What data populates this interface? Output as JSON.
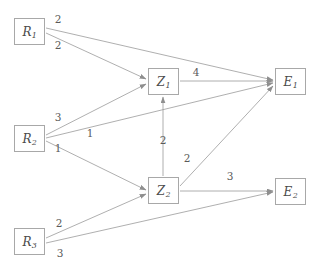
{
  "diagram": {
    "type": "weighted-directed-graph",
    "title": "",
    "nodes": [
      {
        "id": "R1",
        "letter": "R",
        "sub": "1",
        "x": 14,
        "y": 18,
        "w": 31,
        "h": 27
      },
      {
        "id": "R2",
        "letter": "R",
        "sub": "2",
        "x": 14,
        "y": 125,
        "w": 31,
        "h": 27
      },
      {
        "id": "R3",
        "letter": "R",
        "sub": "3",
        "x": 14,
        "y": 228,
        "w": 31,
        "h": 27
      },
      {
        "id": "Z1",
        "letter": "Z",
        "sub": "1",
        "x": 148,
        "y": 68,
        "w": 31,
        "h": 27
      },
      {
        "id": "Z2",
        "letter": "Z",
        "sub": "2",
        "x": 148,
        "y": 177,
        "w": 31,
        "h": 27
      },
      {
        "id": "E1",
        "letter": "E",
        "sub": "1",
        "x": 275,
        "y": 68,
        "w": 31,
        "h": 27
      },
      {
        "id": "E2",
        "letter": "E",
        "sub": "2",
        "x": 275,
        "y": 178,
        "w": 31,
        "h": 27
      }
    ],
    "edges": [
      {
        "id": "e-r1-e1",
        "from": "R1",
        "to": "E1",
        "weight": "2",
        "lx": 58,
        "ly": 19,
        "x1": 46,
        "y1": 28,
        "x2": 273,
        "y2": 80
      },
      {
        "id": "e-r1-z1",
        "from": "R1",
        "to": "Z1",
        "weight": "2",
        "lx": 58,
        "ly": 45,
        "x1": 46,
        "y1": 33,
        "x2": 146,
        "y2": 79
      },
      {
        "id": "e-r2-z1",
        "from": "R2",
        "to": "Z1",
        "weight": "3",
        "lx": 58,
        "ly": 117,
        "x1": 46,
        "y1": 135,
        "x2": 146,
        "y2": 84
      },
      {
        "id": "e-r2-e1",
        "from": "R2",
        "to": "E1",
        "weight": "1",
        "lx": 90,
        "ly": 133,
        "x1": 46,
        "y1": 138,
        "x2": 273,
        "y2": 83
      },
      {
        "id": "e-r2-z2",
        "from": "R2",
        "to": "Z2",
        "weight": "1",
        "lx": 58,
        "ly": 148,
        "x1": 46,
        "y1": 141,
        "x2": 146,
        "y2": 190
      },
      {
        "id": "e-r3-z2",
        "from": "R3",
        "to": "Z2",
        "weight": "2",
        "lx": 59,
        "ly": 223,
        "x1": 46,
        "y1": 238,
        "x2": 146,
        "y2": 194
      },
      {
        "id": "e-r3-e2",
        "from": "R3",
        "to": "E2",
        "weight": "3",
        "lx": 60,
        "ly": 253,
        "x1": 46,
        "y1": 243,
        "x2": 273,
        "y2": 192
      },
      {
        "id": "e-z1-e1",
        "from": "Z1",
        "to": "E1",
        "weight": "4",
        "lx": 196,
        "ly": 72,
        "x1": 180,
        "y1": 81,
        "x2": 273,
        "y2": 81
      },
      {
        "id": "e-z2-z1",
        "from": "Z2",
        "to": "Z1",
        "weight": "2",
        "lx": 163,
        "ly": 140,
        "x1": 163,
        "y1": 176,
        "x2": 163,
        "y2": 97
      },
      {
        "id": "e-z2-e1",
        "from": "Z2",
        "to": "E1",
        "weight": "2",
        "lx": 187,
        "ly": 158,
        "x1": 180,
        "y1": 186,
        "x2": 273,
        "y2": 86
      },
      {
        "id": "e-z2-e2",
        "from": "Z2",
        "to": "E2",
        "weight": "3",
        "lx": 230,
        "ly": 176,
        "x1": 180,
        "y1": 191,
        "x2": 273,
        "y2": 191
      }
    ],
    "colors": {
      "edge_stroke": "#9a9a9a",
      "node_border": "#a8a8a8",
      "node_text": "#4a4a4a",
      "weight_text": "#5a5a5a",
      "background": "#ffffff"
    }
  }
}
